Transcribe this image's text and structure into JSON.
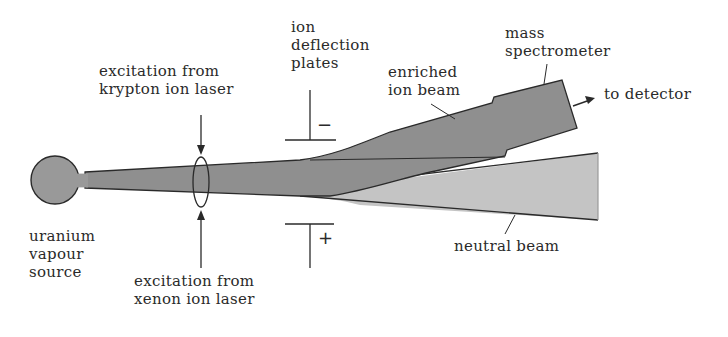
{
  "diagram": {
    "colors": {
      "ion_beam": "#8f8f8f",
      "neutral_beam": "#c4c4c4",
      "source": "#999999",
      "outline": "#2a2a2a",
      "text": "#2a2a2a",
      "background": "#ffffff"
    },
    "labels": {
      "source": [
        "uranium",
        "vapour",
        "source"
      ],
      "krypton_laser": [
        "excitation from",
        "krypton ion laser"
      ],
      "xenon_laser": [
        "excitation from",
        "xenon ion laser"
      ],
      "deflection_plates": [
        "ion",
        "deflection",
        "plates"
      ],
      "enriched_beam": [
        "enriched",
        "ion beam"
      ],
      "mass_spectrometer": [
        "mass",
        "spectrometer"
      ],
      "to_detector": "to detector",
      "neutral_beam": "neutral beam"
    },
    "plate_symbols": {
      "upper": "−",
      "lower": "+"
    }
  }
}
